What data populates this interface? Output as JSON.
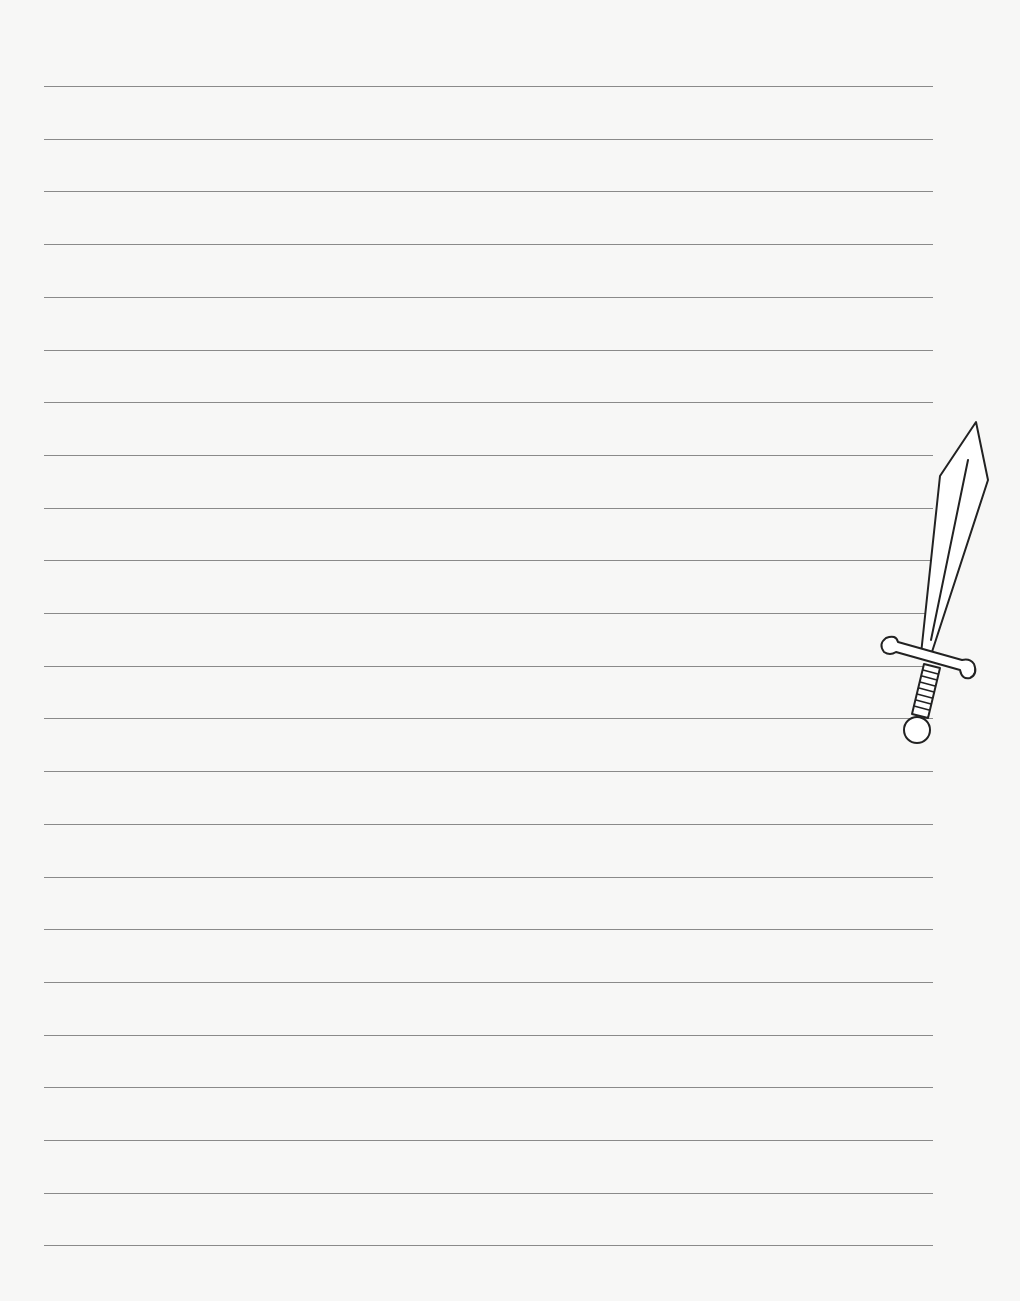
{
  "page": {
    "type": "lined writing paper",
    "background_color": "#f7f7f6",
    "line_color": "#8a8a8a",
    "line_count": 23,
    "line_left": 44,
    "line_width": 889,
    "first_line_y": 86,
    "line_spacing": 52.7
  },
  "illustration": {
    "name": "sword",
    "icon": "sword-icon",
    "stroke_color": "#222222"
  }
}
